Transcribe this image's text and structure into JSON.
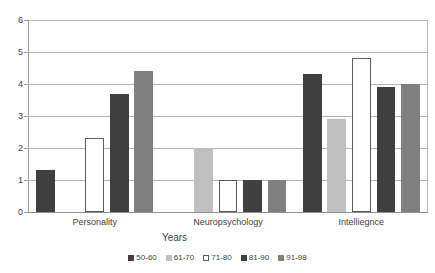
{
  "chart_data": {
    "type": "bar",
    "title": "",
    "subtitle": "",
    "xlabel": "Years",
    "ylabel": "",
    "ylim": [
      0,
      6
    ],
    "y_ticks": [
      0,
      1,
      2,
      3,
      4,
      5,
      6
    ],
    "grid": true,
    "legend_position": "bottom",
    "orientation": "vertical",
    "grouping": "clustered",
    "categories": [
      "Personality",
      "Neuropsychology",
      "Intelliegnce"
    ],
    "series": [
      {
        "name": "50-60",
        "color": "#404040",
        "values": [
          1.3,
          0,
          4.3
        ]
      },
      {
        "name": "61-70",
        "color": "#bfbfbf",
        "values": [
          0,
          2.0,
          2.9
        ]
      },
      {
        "name": "71-80",
        "color": "#ffffff",
        "values": [
          2.3,
          1.0,
          4.8
        ]
      },
      {
        "name": "81-90",
        "color": "#404040",
        "values": [
          3.7,
          1.0,
          3.9
        ]
      },
      {
        "name": "91-98",
        "color": "#808080",
        "values": [
          4.4,
          1.0,
          4.0
        ]
      }
    ]
  },
  "colors": {
    "background": "#ffffff",
    "gridline": "#b3b3b3",
    "axis": "#9a9a9a",
    "text": "#3f3f3f",
    "series_50_60": "#404040",
    "series_61_70": "#bfbfbf",
    "series_71_80": "#ffffff",
    "series_81_90": "#404040",
    "series_91_98": "#808080"
  }
}
